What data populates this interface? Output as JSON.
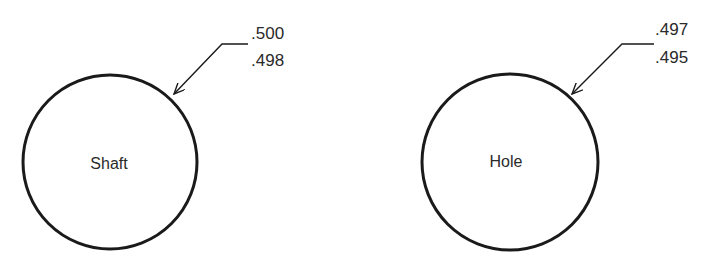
{
  "diagram": {
    "type": "engineering-tolerance-drawing",
    "colors": {
      "stroke": "#1a1a1a",
      "text": "#2a2a2a",
      "background": "#ffffff"
    },
    "parts": [
      {
        "id": "shaft",
        "label": "Shaft",
        "tolerance": {
          "upper": ".500",
          "lower": ".498"
        }
      },
      {
        "id": "hole",
        "label": "Hole",
        "tolerance": {
          "upper": ".497",
          "lower": ".495"
        }
      }
    ]
  }
}
